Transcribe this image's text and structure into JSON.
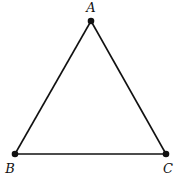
{
  "diagram": {
    "type": "triangle",
    "stroke_color": "#111111",
    "vertices": [
      {
        "label": "A",
        "x": 91,
        "y": 21,
        "label_x": 91,
        "label_y": 12
      },
      {
        "label": "B",
        "x": 15,
        "y": 154,
        "label_x": 10,
        "label_y": 173
      },
      {
        "label": "C",
        "x": 166,
        "y": 154,
        "label_x": 168,
        "label_y": 173
      }
    ],
    "edges": [
      [
        "A",
        "B"
      ],
      [
        "B",
        "C"
      ],
      [
        "C",
        "A"
      ]
    ]
  }
}
